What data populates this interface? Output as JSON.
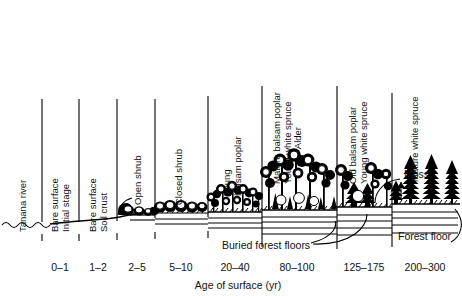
{
  "figure": {
    "type": "successional-cross-section",
    "axis_title": "Age of surface (yr)",
    "background": "#ffffff",
    "ink": "#000000"
  },
  "stages": [
    {
      "id": "tanana-river",
      "lines": [
        "Tanana river"
      ],
      "age": "",
      "label_x": 24,
      "label_baseline": 232,
      "divider_x": 42
    },
    {
      "id": "bare-surface-initial",
      "lines": [
        "Bare surface",
        "Initial stage"
      ],
      "age": "0–1",
      "label_x": 55,
      "label_baseline": 232,
      "divider_x": 79
    },
    {
      "id": "bare-surface-crust",
      "lines": [
        "Bare surface",
        "Soil crust"
      ],
      "age": "1–2",
      "label_x": 93,
      "label_baseline": 232,
      "divider_x": 117
    },
    {
      "id": "open-shrub",
      "lines": [
        "Open shrub"
      ],
      "age": "2–5",
      "label_x": 137,
      "label_baseline": 212,
      "divider_x": 155
    },
    {
      "id": "closed-shrub",
      "lines": [
        "Closed shrub"
      ],
      "age": "5–10",
      "label_x": 174,
      "label_baseline": 212,
      "divider_x": 208
    },
    {
      "id": "young-balsam-poplar",
      "lines": [
        "Young",
        "balsam poplar"
      ],
      "age": "20–40",
      "label_x": 222,
      "label_baseline": 196,
      "divider_x": 262
    },
    {
      "id": "mature-poplar-young-spruce-alder",
      "lines": [
        "Mature balsam poplar",
        "Young white spruce",
        "Alder"
      ],
      "age": "80–100",
      "label_x": 276,
      "label_baseline": 184,
      "divider_x": 337
    },
    {
      "id": "old-poplar-young-spruce",
      "lines": [
        "Old balsam poplar",
        "Young white spruce"
      ],
      "age": "125–175",
      "label_x": 352,
      "label_baseline": 184,
      "divider_x": 392
    },
    {
      "id": "mature-white-spruce",
      "lines": [
        "Mature white spruce"
      ],
      "age": "200–300",
      "label_x": 412,
      "label_baseline": 182,
      "divider_x": null
    }
  ],
  "age_ticks": [
    {
      "label": "0–1",
      "x": 60
    },
    {
      "label": "1–2",
      "x": 98
    },
    {
      "label": "2–5",
      "x": 137
    },
    {
      "label": "5–10",
      "x": 181
    },
    {
      "label": "20–40",
      "x": 235
    },
    {
      "label": "80–100",
      "x": 297
    },
    {
      "label": "125–175",
      "x": 364
    },
    {
      "label": "200–300",
      "x": 425
    }
  ],
  "annotations": [
    {
      "id": "buried-forest-floors",
      "text": "Buried forest floors",
      "x": 222,
      "y": 239
    },
    {
      "id": "forest-floor",
      "text": "Forest floor",
      "x": 398,
      "y": 230
    },
    {
      "id": "moss",
      "text": "Moss",
      "x": 404,
      "y": 175
    }
  ]
}
